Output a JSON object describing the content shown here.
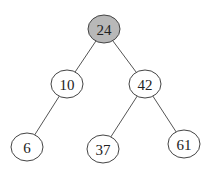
{
  "diagram": {
    "type": "binary-search-tree",
    "highlight_color": "#b8b8b8",
    "nodes": [
      {
        "id": "n24",
        "value": "24",
        "x": 104,
        "y": 29,
        "highlighted": true
      },
      {
        "id": "n10",
        "value": "10",
        "x": 67,
        "y": 84,
        "highlighted": false
      },
      {
        "id": "n42",
        "value": "42",
        "x": 145,
        "y": 84,
        "highlighted": false
      },
      {
        "id": "n6",
        "value": "6",
        "x": 27,
        "y": 147,
        "highlighted": false
      },
      {
        "id": "n37",
        "value": "37",
        "x": 103,
        "y": 149,
        "highlighted": false
      },
      {
        "id": "n61",
        "value": "61",
        "x": 184,
        "y": 144,
        "highlighted": false
      }
    ],
    "edges": [
      {
        "from": "n24",
        "to": "n10"
      },
      {
        "from": "n24",
        "to": "n42"
      },
      {
        "from": "n10",
        "to": "n6"
      },
      {
        "from": "n42",
        "to": "n37"
      },
      {
        "from": "n42",
        "to": "n61"
      }
    ]
  }
}
